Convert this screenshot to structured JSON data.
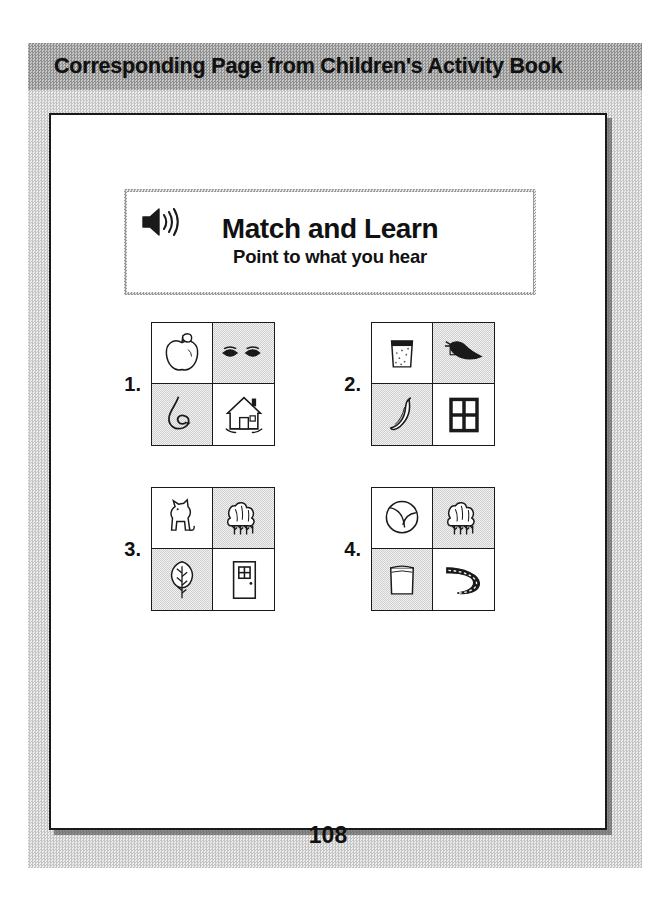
{
  "header": {
    "title": "Corresponding Page from Children's Activity Book",
    "band_color": "#b4b4b4"
  },
  "page": {
    "number": "108",
    "sheet_color": "#ffffff",
    "border_color": "#1a1a1a"
  },
  "title_card": {
    "icon": "speaker-icon",
    "title": "Match and Learn",
    "subtitle": "Point to what you hear"
  },
  "exercises": [
    {
      "number": "1.",
      "cells": [
        {
          "position": "top-left",
          "icon": "apple-icon",
          "label": "apple",
          "shaded": false
        },
        {
          "position": "top-right",
          "icon": "eyes-icon",
          "label": "eyes",
          "shaded": true
        },
        {
          "position": "bottom-left",
          "icon": "snake-icon",
          "label": "snake",
          "shaded": true
        },
        {
          "position": "bottom-right",
          "icon": "house-icon",
          "label": "house",
          "shaded": false
        }
      ]
    },
    {
      "number": "2.",
      "cells": [
        {
          "position": "top-left",
          "icon": "cup-icon",
          "label": "cup",
          "shaded": false
        },
        {
          "position": "top-right",
          "icon": "bird-icon",
          "label": "bird",
          "shaded": true
        },
        {
          "position": "bottom-left",
          "icon": "banana-icon",
          "label": "banana",
          "shaded": true
        },
        {
          "position": "bottom-right",
          "icon": "window-icon",
          "label": "window",
          "shaded": false
        }
      ]
    },
    {
      "number": "3.",
      "cells": [
        {
          "position": "top-left",
          "icon": "cat-icon",
          "label": "cat",
          "shaded": false
        },
        {
          "position": "top-right",
          "icon": "trees-icon",
          "label": "trees",
          "shaded": true
        },
        {
          "position": "bottom-left",
          "icon": "tree-icon",
          "label": "tree",
          "shaded": true
        },
        {
          "position": "bottom-right",
          "icon": "door-icon",
          "label": "door",
          "shaded": false
        }
      ]
    },
    {
      "number": "4.",
      "cells": [
        {
          "position": "top-left",
          "icon": "ball-icon",
          "label": "ball",
          "shaded": false
        },
        {
          "position": "top-right",
          "icon": "trees-icon",
          "label": "trees",
          "shaded": true
        },
        {
          "position": "bottom-left",
          "icon": "box-icon",
          "label": "box",
          "shaded": true
        },
        {
          "position": "bottom-right",
          "icon": "road-icon",
          "label": "road",
          "shaded": false
        }
      ]
    }
  ]
}
